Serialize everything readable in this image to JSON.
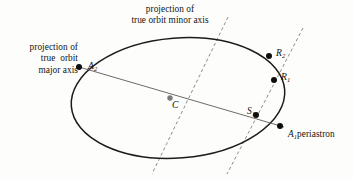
{
  "figure": {
    "type": "astronomy-orbit-projection-diagram",
    "background_color": "#fdfdfc",
    "stroke_color": "#1c1c1c",
    "axis_line_color": "#6b6b6b",
    "dashed_line_color": "#8c8c8c",
    "point_color": "#0d0d0d",
    "center_point_color": "#7a7a7a"
  },
  "annotations": {
    "major_axis_label": "projection of\ntrue  orbit\nmajor axis",
    "minor_axis_label": "projection of\ntrue orbit minor axis",
    "periastron_label": "periastron"
  },
  "points": [
    {
      "id": "A2",
      "symbol": "A",
      "subscript": "2",
      "x": 79,
      "y": 67,
      "on_ellipse": true,
      "fill": "#0d0d0d",
      "r": 3.0
    },
    {
      "id": "C",
      "symbol": "C",
      "subscript": "",
      "x": 170,
      "y": 98,
      "on_ellipse": false,
      "fill": "#7a7a7a",
      "r": 2.7
    },
    {
      "id": "S1",
      "symbol": "S",
      "subscript": "1",
      "x": 256,
      "y": 115,
      "on_ellipse": false,
      "fill": "#0d0d0d",
      "r": 3.0
    },
    {
      "id": "A1",
      "symbol": "A",
      "subscript": "1",
      "x": 280,
      "y": 126,
      "on_ellipse": true,
      "fill": "#0d0d0d",
      "r": 3.0
    },
    {
      "id": "R1",
      "symbol": "R",
      "subscript": "1",
      "x": 274,
      "y": 80,
      "on_ellipse": true,
      "fill": "#0d0d0d",
      "r": 3.0
    },
    {
      "id": "R2",
      "symbol": "R",
      "subscript": "2",
      "x": 269,
      "y": 56,
      "on_ellipse": false,
      "fill": "#0d0d0d",
      "r": 3.0
    }
  ],
  "ellipse": {
    "cx": 178,
    "cy": 98,
    "rx": 107,
    "ry": 60,
    "rotation_deg": -4.5,
    "stroke_width": 1.5
  },
  "major_axis_segment": {
    "x1": 79,
    "y1": 67,
    "x2": 284,
    "y2": 127
  },
  "dashed_lines": [
    {
      "name": "minor-axis-projection",
      "x1": 228,
      "y1": 17,
      "x2": 152,
      "y2": 174
    },
    {
      "name": "apsidal-projection",
      "x1": 303,
      "y1": 28,
      "x2": 227,
      "y2": 174
    }
  ]
}
